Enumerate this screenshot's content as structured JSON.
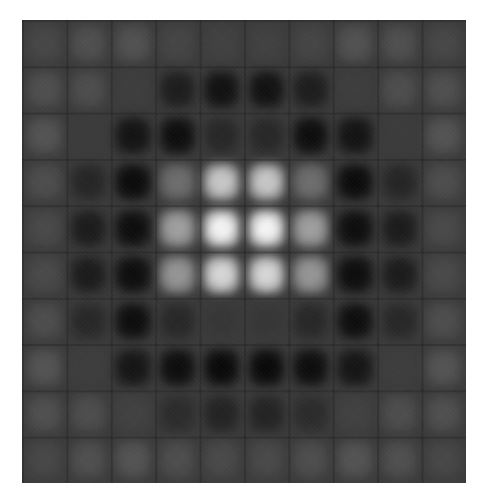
{
  "image": {
    "description": "Grayscale 10x10 grid pattern with bright center, dark ring, faint outer ring",
    "background_gray": 60,
    "intensity_grid": [
      [
        72,
        80,
        82,
        70,
        66,
        66,
        70,
        82,
        80,
        72
      ],
      [
        80,
        78,
        62,
        30,
        18,
        18,
        30,
        62,
        78,
        80
      ],
      [
        84,
        60,
        20,
        14,
        40,
        40,
        14,
        20,
        60,
        84
      ],
      [
        78,
        38,
        12,
        110,
        200,
        200,
        110,
        12,
        38,
        78
      ],
      [
        74,
        28,
        14,
        160,
        245,
        245,
        160,
        14,
        28,
        74
      ],
      [
        74,
        28,
        14,
        150,
        215,
        215,
        150,
        14,
        28,
        74
      ],
      [
        78,
        40,
        14,
        40,
        55,
        55,
        40,
        14,
        40,
        78
      ],
      [
        84,
        62,
        22,
        14,
        10,
        10,
        14,
        22,
        62,
        84
      ],
      [
        80,
        78,
        66,
        44,
        36,
        36,
        44,
        66,
        78,
        80
      ],
      [
        72,
        80,
        84,
        78,
        74,
        74,
        78,
        84,
        80,
        72
      ]
    ]
  }
}
